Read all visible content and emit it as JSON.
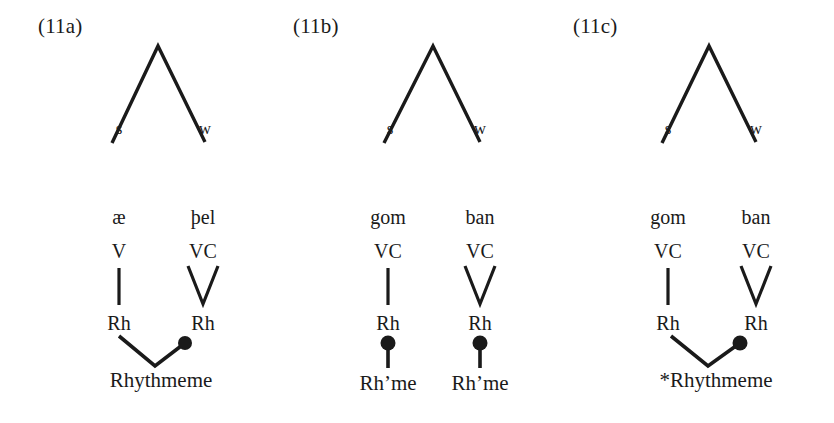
{
  "figure": {
    "background_color": "#ffffff",
    "ink_color": "#1a1a1a"
  },
  "panels": [
    {
      "label": "(11a)",
      "tree": {
        "strong_label": "s",
        "weak_label": "w"
      },
      "left_branch": {
        "syllable": "æ",
        "weight": "V",
        "connector": "vertical-bar",
        "rhyme": "Rh"
      },
      "right_branch": {
        "syllable": "þel",
        "weight": "VC",
        "connector": "vee",
        "rhyme": "Rh"
      },
      "foot": {
        "label": "Rhythmeme",
        "connector": "vee-with-dot-right",
        "dot_on": "right"
      }
    },
    {
      "label": "(11b)",
      "tree": {
        "strong_label": "s",
        "weak_label": "w"
      },
      "left_branch": {
        "syllable": "gom",
        "weight": "VC",
        "connector": "vertical-bar",
        "rhyme": "Rh"
      },
      "right_branch": {
        "syllable": "ban",
        "weight": "VC",
        "connector": "vee",
        "rhyme": "Rh"
      },
      "foot_left": {
        "label": "Rh’me",
        "connector": "dot-with-stem",
        "dot_on": "top"
      },
      "foot_right": {
        "label": "Rh’me",
        "connector": "dot-with-stem",
        "dot_on": "top"
      }
    },
    {
      "label": "(11c)",
      "tree": {
        "strong_label": "s",
        "weak_label": "w"
      },
      "left_branch": {
        "syllable": "gom",
        "weight": "VC",
        "connector": "vertical-bar",
        "rhyme": "Rh"
      },
      "right_branch": {
        "syllable": "ban",
        "weight": "VC",
        "connector": "vee",
        "rhyme": "Rh"
      },
      "foot": {
        "label": "*Rhythmeme",
        "connector": "vee-with-dot-right",
        "dot_on": "right"
      }
    }
  ]
}
